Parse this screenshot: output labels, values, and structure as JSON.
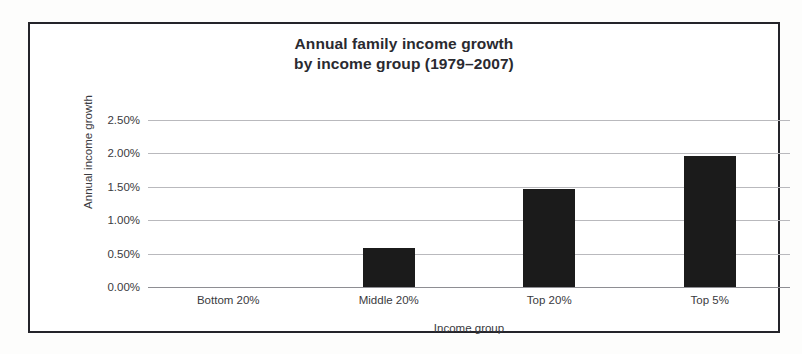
{
  "chart_data": {
    "type": "bar",
    "title": "Annual family income growth\nby income group (1979–2007)",
    "title_line1": "Annual family income growth",
    "title_line2": "by income group (1979–2007)",
    "categories": [
      "Bottom 20%",
      "Middle 20%",
      "Top 20%",
      "Top 5%"
    ],
    "values": [
      0.0,
      0.58,
      1.47,
      1.96
    ],
    "value_labels": [
      "0.00%",
      "0.58%",
      "1.47%",
      "1.96%"
    ],
    "xlabel": "Income group",
    "ylabel": "Annual income growth",
    "ylim": [
      0.0,
      2.5
    ],
    "ytick_values": [
      0.0,
      0.5,
      1.0,
      1.5,
      2.0,
      2.5
    ],
    "ytick_labels": [
      "0.00%",
      "0.50%",
      "1.00%",
      "1.50%",
      "2.00%",
      "2.50%"
    ],
    "grid": true,
    "legend": false,
    "bar_color": "#1b1b1b",
    "gridline_color": "#b9b9bd",
    "frame_color": "#24242a",
    "units": "percent per year"
  }
}
